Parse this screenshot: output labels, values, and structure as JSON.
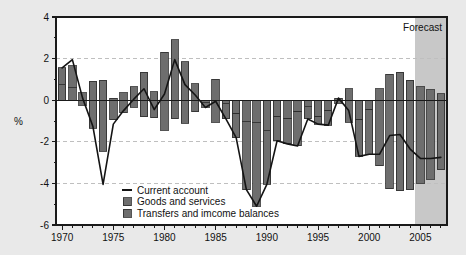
{
  "chart_data": {
    "type": "bar",
    "title": "",
    "subtitle": "",
    "xlabel": "",
    "ylabel": "%",
    "ylim": [
      -6,
      4
    ],
    "xlim": [
      1969.4,
      2007.6
    ],
    "yticks": [
      "4",
      "2",
      "0",
      "-2",
      "-4",
      "-6"
    ],
    "ytick_values": [
      4,
      2,
      0,
      -2,
      -4,
      -6
    ],
    "xticks": [
      "1970",
      "1975",
      "1980",
      "1985",
      "1990",
      "1995",
      "2000",
      "2005"
    ],
    "xtick_values": [
      1970,
      1975,
      1980,
      1985,
      1990,
      1995,
      2000,
      2005
    ],
    "grid": "horizontal-dashed",
    "legend_position": "inside-bottom-left",
    "stacked": true,
    "x": [
      1970,
      1971,
      1972,
      1973,
      1974,
      1975,
      1976,
      1977,
      1978,
      1979,
      1980,
      1981,
      1982,
      1983,
      1984,
      1985,
      1986,
      1987,
      1988,
      1989,
      1990,
      1991,
      1992,
      1993,
      1994,
      1995,
      1996,
      1997,
      1998,
      1999,
      2000,
      2001,
      2002,
      2003,
      2004,
      2005,
      2006,
      2007
    ],
    "series": [
      {
        "name": "Goods and services",
        "type": "bar-segment",
        "values": [
          0.75,
          0.6,
          0.35,
          0.9,
          0.95,
          0.1,
          0.35,
          0.65,
          1.35,
          0.4,
          2.3,
          2.9,
          1.85,
          0.8,
          -0.1,
          1.0,
          -0.15,
          -0.65,
          -1.0,
          -1.05,
          -1.45,
          -0.8,
          -0.9,
          -0.55,
          -0.3,
          -0.8,
          -0.5,
          0.1,
          0.55,
          -0.95,
          -0.45,
          0.55,
          1.25,
          1.35,
          0.95,
          0.65,
          0.5,
          0.3
        ]
      },
      {
        "name": "Transfers and imcome balances",
        "type": "bar-segment",
        "values": [
          0.8,
          1.05,
          -0.25,
          -1.35,
          -2.45,
          -0.95,
          -0.6,
          -0.35,
          -0.8,
          -0.85,
          -1.45,
          -0.9,
          -1.1,
          -0.55,
          -0.25,
          -1.05,
          -0.75,
          -1.15,
          -3.3,
          -4.05,
          -2.6,
          -1.15,
          -1.2,
          -1.65,
          -0.6,
          -0.35,
          -0.7,
          -0.15,
          -1.05,
          -1.75,
          -2.15,
          -3.15,
          -4.25,
          -4.35,
          -4.3,
          -4.0,
          -3.8,
          -3.35
        ]
      },
      {
        "name": "Current account",
        "type": "line",
        "values": [
          1.55,
          1.95,
          0.1,
          -1.25,
          -4.05,
          -1.15,
          -0.5,
          0.05,
          0.55,
          -0.45,
          0.3,
          1.95,
          0.75,
          0.25,
          -0.35,
          -0.05,
          -0.9,
          -1.8,
          -4.3,
          -5.1,
          -4.05,
          -1.95,
          -2.1,
          -2.2,
          -0.9,
          -1.15,
          -1.2,
          0.1,
          -0.5,
          -2.7,
          -2.6,
          -2.6,
          -1.7,
          -1.65,
          -2.35,
          -2.8,
          -2.8,
          -2.75
        ]
      }
    ],
    "annotations": [
      {
        "name": "forecast",
        "label": "Forecast",
        "start_x": 2004.5,
        "end_x": 2007.6,
        "shade_color": "#c8c8c8"
      }
    ],
    "colors": {
      "bar_fill": "#6e6e6e",
      "bar_edge": "#2b2b2b",
      "line": "#141414",
      "grid": "#bfbfbf",
      "axis": "#1a1a1a",
      "plot_bg": "#ffffff",
      "page_bg": "#e9e9e9",
      "forecast_shade": "#c8c8c8"
    }
  },
  "legend": {
    "items": [
      {
        "label": "Current account",
        "marker": "line"
      },
      {
        "label": "Goods and services",
        "marker": "swatch"
      },
      {
        "label": "Transfers and imcome balances",
        "marker": "swatch"
      }
    ]
  },
  "axes": {
    "y_axis_title": "%"
  }
}
